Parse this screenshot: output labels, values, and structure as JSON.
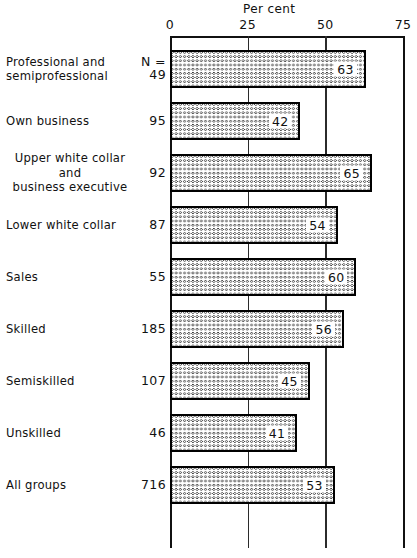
{
  "chart_data": {
    "type": "bar",
    "orientation": "horizontal",
    "title": "",
    "xlabel": "Per cent",
    "ylabel": "",
    "xlim": [
      0,
      75
    ],
    "xticks": [
      0,
      25,
      50,
      75
    ],
    "xtick_labels": [
      "0",
      "25",
      "50",
      "75"
    ],
    "grid": true,
    "grid_axis": "x",
    "legend": "none",
    "n_column_header": "N =",
    "categories": [
      "Professional and semiprofessional",
      "Own business",
      "Upper white collar and business executive",
      "Lower white collar",
      "Sales",
      "Skilled",
      "Semiskilled",
      "Unskilled",
      "All groups"
    ],
    "values": [
      63,
      42,
      65,
      54,
      60,
      56,
      45,
      41,
      53
    ],
    "n_values": [
      49,
      95,
      92,
      87,
      55,
      185,
      107,
      46,
      716
    ]
  },
  "axis": {
    "title": "Per cent",
    "ticks": [
      {
        "label": "0",
        "value": 0
      },
      {
        "label": "25",
        "value": 25
      },
      {
        "label": "50",
        "value": 50
      },
      {
        "label": "75",
        "value": 75
      }
    ]
  },
  "rows": [
    {
      "label_lines": [
        "Professional and",
        "semiprofessional"
      ],
      "align": "left",
      "n_prefix": "N =",
      "n": "49",
      "value": "63",
      "value_num": 63
    },
    {
      "label_lines": [
        "Own business"
      ],
      "align": "left",
      "n_prefix": "",
      "n": "95",
      "value": "42",
      "value_num": 42
    },
    {
      "label_lines": [
        "Upper white collar",
        "and",
        "business executive"
      ],
      "align": "mid",
      "n_prefix": "",
      "n": "92",
      "value": "65",
      "value_num": 65
    },
    {
      "label_lines": [
        "Lower white collar"
      ],
      "align": "left",
      "n_prefix": "",
      "n": "87",
      "value": "54",
      "value_num": 54
    },
    {
      "label_lines": [
        "Sales"
      ],
      "align": "left",
      "n_prefix": "",
      "n": "55",
      "value": "60",
      "value_num": 60
    },
    {
      "label_lines": [
        "Skilled"
      ],
      "align": "left",
      "n_prefix": "",
      "n": "185",
      "value": "56",
      "value_num": 56
    },
    {
      "label_lines": [
        "Semiskilled"
      ],
      "align": "left",
      "n_prefix": "",
      "n": "107",
      "value": "45",
      "value_num": 45
    },
    {
      "label_lines": [
        "Unskilled"
      ],
      "align": "left",
      "n_prefix": "",
      "n": "46",
      "value": "41",
      "value_num": 41
    },
    {
      "label_lines": [
        "All groups"
      ],
      "align": "left",
      "n_prefix": "",
      "n": "716",
      "value": "53",
      "value_num": 53
    }
  ],
  "style": {
    "ink": "#111111",
    "paper": "#ffffff",
    "hatch": "#282828"
  }
}
